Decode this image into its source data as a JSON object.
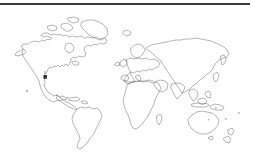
{
  "page": {
    "background_color": "#ffffff",
    "width": 255,
    "height": 154
  },
  "top_rule": {
    "name": "horizontal-rule",
    "color": "#3a3a3a",
    "thickness": 2
  },
  "map": {
    "title": "World Map Outline",
    "projection_style": "simplified-coastline-outline",
    "stroke_color": "#5a5a5a",
    "fill_color": "none",
    "island_dot_color": "#b4b4b4",
    "marker": {
      "label": "location-marker",
      "color": "#2e2e2e",
      "region": "Baja California / Western Mexico",
      "x": 45,
      "y": 77
    },
    "landmasses": [
      {
        "name": "north-america",
        "label": "North America"
      },
      {
        "name": "greenland",
        "label": "Greenland"
      },
      {
        "name": "iceland",
        "label": "Iceland"
      },
      {
        "name": "central-america",
        "label": "Central America"
      },
      {
        "name": "caribbean",
        "label": "Caribbean Islands"
      },
      {
        "name": "south-america",
        "label": "South America"
      },
      {
        "name": "africa",
        "label": "Africa"
      },
      {
        "name": "europe",
        "label": "Europe"
      },
      {
        "name": "british-isles",
        "label": "British Isles"
      },
      {
        "name": "scandinavia",
        "label": "Scandinavia"
      },
      {
        "name": "asia",
        "label": "Asia"
      },
      {
        "name": "india",
        "label": "India"
      },
      {
        "name": "southeast-asia",
        "label": "Southeast Asia"
      },
      {
        "name": "japan",
        "label": "Japan"
      },
      {
        "name": "indonesia",
        "label": "Indonesia"
      },
      {
        "name": "new-guinea",
        "label": "New Guinea"
      },
      {
        "name": "australia",
        "label": "Australia"
      },
      {
        "name": "new-zealand",
        "label": "New Zealand"
      },
      {
        "name": "madagascar",
        "label": "Madagascar"
      }
    ],
    "island_dots": [
      {
        "name": "hawaii",
        "x": 27,
        "y": 91
      },
      {
        "name": "pacific-island-a",
        "x": 216,
        "y": 108
      },
      {
        "name": "pacific-island-b",
        "x": 226,
        "y": 119
      },
      {
        "name": "pacific-island-c",
        "x": 239,
        "y": 113
      },
      {
        "name": "pacific-island-d",
        "x": 209,
        "y": 120
      }
    ]
  }
}
